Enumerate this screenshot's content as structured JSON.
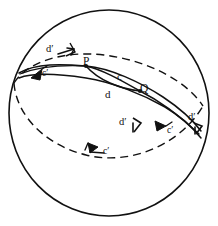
{
  "figure": {
    "type": "geometry-diagram",
    "stroke_color": "#111111",
    "background_color": "#ffffff",
    "sphere": {
      "center_x": 109,
      "center_y": 113,
      "radius_x": 100,
      "radius_y": 103
    },
    "points": [
      {
        "name": "P",
        "label": "P",
        "x": 86,
        "y": 66
      },
      {
        "name": "Q",
        "label": "Q",
        "x": 140,
        "y": 91
      }
    ],
    "segment_labels": [
      {
        "name": "c",
        "label": "c",
        "x": 118,
        "y": 76
      },
      {
        "name": "d",
        "label": "d",
        "x": 107,
        "y": 94
      }
    ],
    "prime_labels": [
      {
        "name": "d-prime-upper-left",
        "label": "d′",
        "x": 49,
        "y": 51
      },
      {
        "name": "c-prime-upper-left",
        "label": "c′",
        "x": 44,
        "y": 74
      },
      {
        "name": "d-prime-center",
        "label": "d′",
        "x": 120,
        "y": 124
      },
      {
        "name": "c-prime-lower-left",
        "label": "c′",
        "x": 105,
        "y": 152
      },
      {
        "name": "c-prime-right",
        "label": "c′",
        "x": 170,
        "y": 131
      },
      {
        "name": "d-prime-right",
        "label": "d′",
        "x": 190,
        "y": 118
      }
    ]
  }
}
